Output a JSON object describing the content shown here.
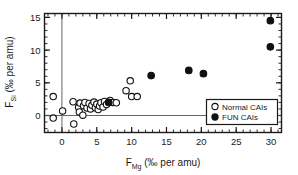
{
  "chart_data": {
    "type": "scatter",
    "title": "",
    "xlabel": "F_Mg (‰ per amu)",
    "ylabel": "F_Si (‰ per amu)",
    "xlabel_base": "F",
    "xlabel_sub": "Mg",
    "xlabel_unit": "(‰ per amu)",
    "ylabel_base": "F",
    "ylabel_sub": "Si",
    "ylabel_unit": "(‰ per amu)",
    "xlim": [
      -2.5,
      31.5
    ],
    "ylim": [
      -2.6,
      15.6
    ],
    "xticks": [
      0,
      5,
      10,
      15,
      20,
      25,
      30
    ],
    "yticks": [
      0,
      5,
      10,
      15
    ],
    "xtick_labels": [
      "0",
      "5",
      "10",
      "15",
      "20",
      "25",
      "30"
    ],
    "ytick_labels": [
      "0",
      "5",
      "10",
      "15"
    ],
    "x_minor_step": 1,
    "y_minor_step": 1,
    "grid": false,
    "reference_lines": {
      "x": 0,
      "y": 0
    },
    "legend_position": "lower-right",
    "series": [
      {
        "name": "Normal CAIs",
        "marker": "open-circle",
        "color": "#ffffff",
        "edge_color": "#111111",
        "points": [
          [
            -1.25,
            2.9
          ],
          [
            -1.25,
            -0.4
          ],
          [
            0.1,
            0.7
          ],
          [
            1.7,
            -1.3
          ],
          [
            1.6,
            2.1
          ],
          [
            2.4,
            1.25
          ],
          [
            2.5,
            0.55
          ],
          [
            2.6,
            1.9
          ],
          [
            3.0,
            0.05
          ],
          [
            3.1,
            1.5
          ],
          [
            3.3,
            2.0
          ],
          [
            3.6,
            1.15
          ],
          [
            3.9,
            1.85
          ],
          [
            4.1,
            1.0
          ],
          [
            4.3,
            1.55
          ],
          [
            4.6,
            2.05
          ],
          [
            4.8,
            1.2
          ],
          [
            5.0,
            1.75
          ],
          [
            5.2,
            0.9
          ],
          [
            5.4,
            1.45
          ],
          [
            5.6,
            1.95
          ],
          [
            5.9,
            1.3
          ],
          [
            6.1,
            2.15
          ],
          [
            6.4,
            1.7
          ],
          [
            6.9,
            2.3
          ],
          [
            7.3,
            2.0
          ],
          [
            7.8,
            1.95
          ],
          [
            9.2,
            3.8
          ],
          [
            9.8,
            5.3
          ],
          [
            10.0,
            2.9
          ],
          [
            10.8,
            2.9
          ]
        ]
      },
      {
        "name": "FUN CAIs",
        "marker": "filled-circle",
        "color": "#111111",
        "edge_color": "#111111",
        "points": [
          [
            6.7,
            2.0
          ],
          [
            12.8,
            6.1
          ],
          [
            18.2,
            6.9
          ],
          [
            20.3,
            6.4
          ],
          [
            29.9,
            14.5
          ],
          [
            29.9,
            10.5
          ]
        ]
      }
    ]
  },
  "legend": {
    "entries": [
      {
        "label": "Normal CAIs",
        "marker": "open-circle"
      },
      {
        "label": "FUN CAIs",
        "marker": "filled-circle"
      }
    ]
  }
}
